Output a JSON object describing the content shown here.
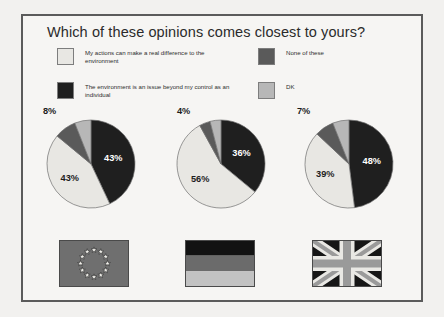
{
  "chart_title": "Which of these opinions comes closest to yours?",
  "colors": {
    "opinion_actions": "#e8e7e3",
    "opinion_beyond": "#1f1f1f",
    "none_of_these": "#5a5a5a",
    "dk": "#b7b7b7",
    "frame_border": "#5b5b5b",
    "background": "#f6f5f3",
    "text": "#2b2b2b"
  },
  "legend": {
    "items": [
      {
        "label": "My actions can make a real difference to the environment",
        "key": "opinion_actions",
        "swatch": "#e8e7e3"
      },
      {
        "label": "The environment is an issue beyond my control as an individual",
        "key": "opinion_beyond",
        "swatch": "#1f1f1f"
      },
      {
        "label": "None of these",
        "key": "none_of_these",
        "swatch": "#5a5a5a"
      },
      {
        "label": "DK",
        "key": "dk",
        "swatch": "#b7b7b7"
      }
    ]
  },
  "flags": [
    {
      "name": "european-union-flag",
      "alt": "European Union"
    },
    {
      "name": "germany-flag",
      "alt": "Germany"
    },
    {
      "name": "united-kingdom-flag",
      "alt": "United Kingdom"
    }
  ],
  "chart_data": {
    "type": "pie",
    "title": "Which of these opinions comes closest to yours?",
    "xlabel": "",
    "ylabel": "",
    "legend_position": "top",
    "units": "%",
    "categories": [
      "The environment is an issue beyond my control as an individual",
      "My actions can make a real difference to the environment",
      "None of these",
      "DK"
    ],
    "charts": [
      {
        "group": "European Union",
        "flag": "european-union-flag",
        "slices": [
          {
            "category": "The environment is an issue beyond my control as an individual",
            "value": 43,
            "label": "43%",
            "color": "#1f1f1f",
            "label_position": "inside"
          },
          {
            "category": "My actions can make a real difference to the environment",
            "value": 43,
            "label": "43%",
            "color": "#e8e7e3",
            "label_position": "inside"
          },
          {
            "category": "None of these",
            "value": 8,
            "label": "8%",
            "color": "#5a5a5a",
            "label_position": "outside"
          },
          {
            "category": "DK",
            "value": 6,
            "label": "",
            "color": "#b7b7b7",
            "label_position": "none"
          }
        ]
      },
      {
        "group": "Germany",
        "flag": "germany-flag",
        "slices": [
          {
            "category": "The environment is an issue beyond my control as an individual",
            "value": 36,
            "label": "36%",
            "color": "#1f1f1f",
            "label_position": "inside"
          },
          {
            "category": "My actions can make a real difference to the environment",
            "value": 56,
            "label": "56%",
            "color": "#e8e7e3",
            "label_position": "inside"
          },
          {
            "category": "None of these",
            "value": 4,
            "label": "4%",
            "color": "#5a5a5a",
            "label_position": "outside"
          },
          {
            "category": "DK",
            "value": 4,
            "label": "",
            "color": "#b7b7b7",
            "label_position": "none"
          }
        ]
      },
      {
        "group": "United Kingdom",
        "flag": "united-kingdom-flag",
        "slices": [
          {
            "category": "The environment is an issue beyond my control as an individual",
            "value": 48,
            "label": "48%",
            "color": "#1f1f1f",
            "label_position": "inside"
          },
          {
            "category": "My actions can make a real difference to the environment",
            "value": 39,
            "label": "39%",
            "color": "#e8e7e3",
            "label_position": "inside"
          },
          {
            "category": "None of these",
            "value": 7,
            "label": "7%",
            "color": "#5a5a5a",
            "label_position": "outside"
          },
          {
            "category": "DK",
            "value": 6,
            "label": "",
            "color": "#b7b7b7",
            "label_position": "none"
          }
        ]
      }
    ]
  }
}
